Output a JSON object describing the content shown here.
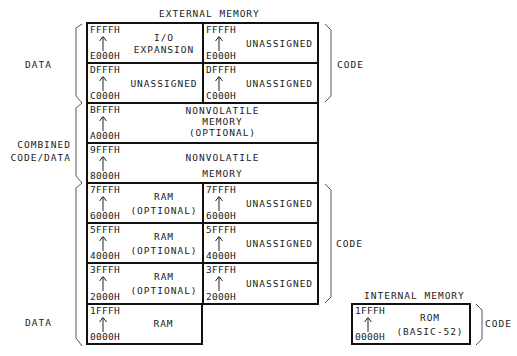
{
  "external": {
    "title": "EXTERNAL MEMORY",
    "rows": [
      {
        "left": {
          "hi": "FFFFH",
          "lo": "E000H",
          "text": "I/O\nEXPANSION"
        },
        "right": {
          "hi": "FFFFH",
          "lo": "E000H",
          "text": "UNASSIGNED"
        }
      },
      {
        "left": {
          "hi": "DFFFH",
          "lo": "C000H",
          "text": "UNASSIGNED"
        },
        "right": {
          "hi": "DFFFH",
          "lo": "C000H",
          "text": "UNASSIGNED"
        }
      },
      {
        "full": {
          "hi": "BFFFH",
          "lo": "A000H",
          "text": "NONVOLATILE\nMEMORY\n(OPTIONAL)"
        }
      },
      {
        "full": {
          "hi": "9FFFH",
          "lo": "8000H",
          "text": "NONVOLATILE\nMEMORY"
        }
      },
      {
        "left": {
          "hi": "7FFFH",
          "lo": "6000H",
          "text": "RAM\n(OPTIONAL)"
        },
        "right": {
          "hi": "7FFFH",
          "lo": "6000H",
          "text": "UNASSIGNED"
        }
      },
      {
        "left": {
          "hi": "5FFFH",
          "lo": "4000H",
          "text": "RAM\n(OPTIONAL)"
        },
        "right": {
          "hi": "5FFFH",
          "lo": "4000H",
          "text": "UNASSIGNED"
        }
      },
      {
        "left": {
          "hi": "3FFFH",
          "lo": "2000H",
          "text": "RAM\n(OPTIONAL)"
        },
        "right": {
          "hi": "3FFFH",
          "lo": "2000H",
          "text": "UNASSIGNED"
        }
      },
      {
        "left": {
          "hi": "1FFFH",
          "lo": "0000H",
          "text": "RAM"
        }
      }
    ]
  },
  "internal": {
    "title": "INTERNAL MEMORY",
    "hi": "1FFFH",
    "lo": "0000H",
    "text": "ROM\n(BASIC-52)"
  },
  "brackets": {
    "left_top": "DATA",
    "left_mid": "COMBINED\nCODE/DATA",
    "left_bottom": "DATA",
    "right_top": "CODE",
    "right_bottom": "CODE",
    "internal_right": "CODE"
  },
  "icons": {
    "address_arrow": "up-arrow-icon"
  }
}
